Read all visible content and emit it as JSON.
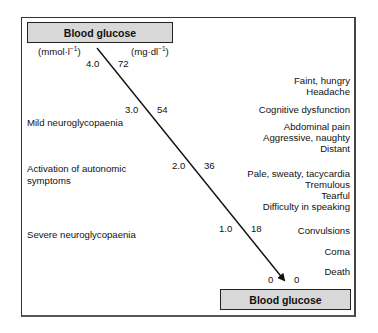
{
  "header": {
    "top_label": "Blood glucose",
    "bottom_label": "Blood glucose"
  },
  "units": {
    "mmol": "(mmol·l",
    "mmol_sup": "−1",
    "mmol_close": ")",
    "mgdl": "(mg·dl",
    "mgdl_sup": "−1",
    "mgdl_close": ")"
  },
  "scale": [
    {
      "mmol": "4.0",
      "mgdl": "72"
    },
    {
      "mmol": "3.0",
      "mgdl": "54"
    },
    {
      "mmol": "2.0",
      "mgdl": "36"
    },
    {
      "mmol": "1.0",
      "mgdl": "18"
    },
    {
      "mmol": "0",
      "mgdl": "0"
    }
  ],
  "stages": [
    {
      "label": "Mild neuroglycopaenia"
    },
    {
      "label_line1": "Activation of autonomic",
      "label_line2": "symptoms"
    },
    {
      "label": "Severe neuroglycopaenia"
    }
  ],
  "symptoms": {
    "group1": [
      "Faint, hungry",
      "Headache"
    ],
    "group2": [
      "Cognitive dysfunction"
    ],
    "group3": [
      "Abdominal pain",
      "Aggressive, naughty",
      "Distant"
    ],
    "group4": [
      "Pale, sweaty, tacycardia",
      "Tremulous",
      "Tearful",
      "Difficulty in speaking"
    ],
    "group5": [
      "Convulsions"
    ],
    "group6": [
      "Coma"
    ],
    "group7": [
      "Death"
    ]
  },
  "colors": {
    "box_fill": "#d8d8d8",
    "line": "#111111",
    "border": "#333333"
  }
}
